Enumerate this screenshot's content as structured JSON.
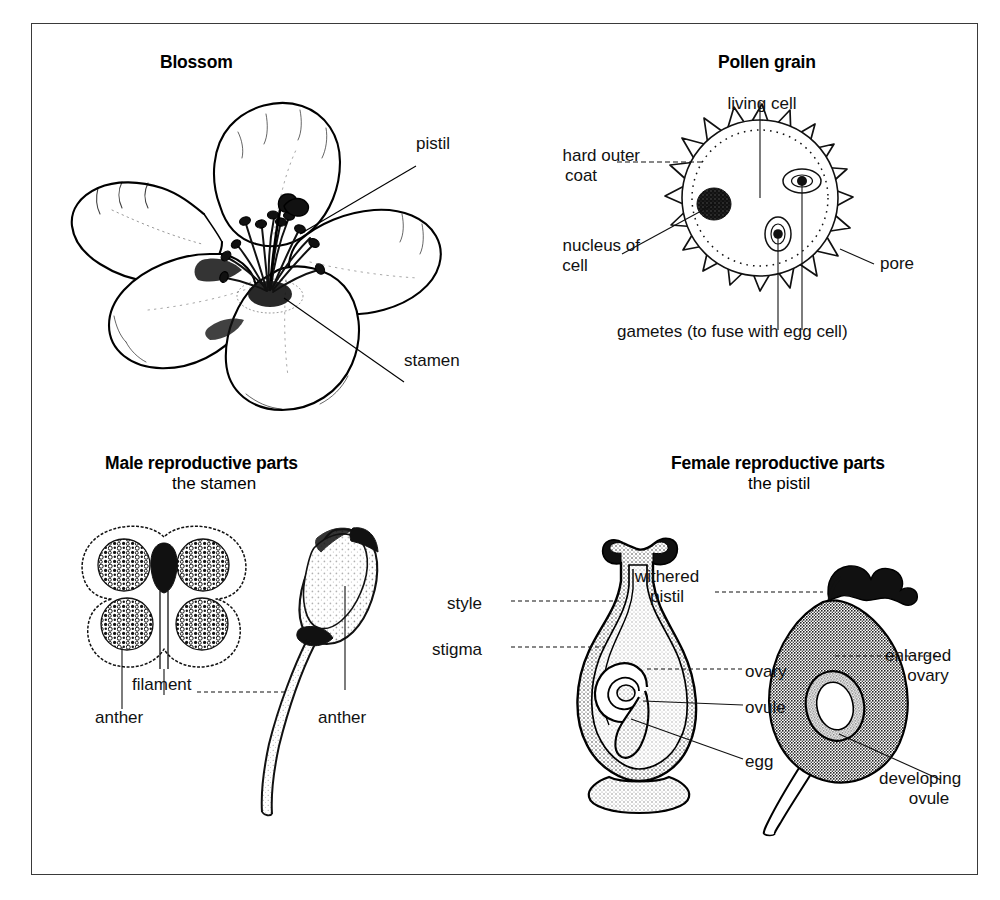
{
  "figure": {
    "title_visible": false,
    "background_color": "#ffffff",
    "frame_color": "#3a3a3a",
    "ink_color": "#000000"
  },
  "panels": {
    "blossom": {
      "heading": "Blossom",
      "labels": {
        "pistil": "pistil",
        "stamen": "stamen"
      }
    },
    "pollen_grain": {
      "heading": "Pollen grain",
      "labels": {
        "living_cell": "living cell",
        "hard_outer_coat_line1": "hard outer",
        "hard_outer_coat_line2": "coat",
        "nucleus_line1": "nucleus of",
        "nucleus_line2": "cell",
        "pore": "pore",
        "gametes": "gametes (to fuse with egg cell)"
      }
    },
    "male_parts": {
      "heading": "Male reproductive parts",
      "subheading": "the stamen",
      "labels": {
        "anther_left": "anther",
        "filament": "filament",
        "anther_right": "anther"
      }
    },
    "female_parts": {
      "heading": "Female reproductive parts",
      "subheading": "the pistil",
      "labels": {
        "style": "style",
        "stigma": "stigma",
        "ovary": "ovary",
        "ovule": "ovule",
        "egg": "egg",
        "withered_pistil_line1": "withered",
        "withered_pistil_line2": "pistil",
        "enlarged_ovary_line1": "enlarged",
        "enlarged_ovary_line2": "ovary",
        "developing_ovule_line1": "developing",
        "developing_ovule_line2": "ovule"
      }
    }
  },
  "icons": {
    "flower": "blossom-icon",
    "pollen": "pollen-grain-icon",
    "anther_cross_section": "anther-cross-section-icon",
    "stamen_side": "stamen-side-view-icon",
    "pistil": "pistil-icon",
    "developing_fruit": "developing-fruit-icon"
  }
}
